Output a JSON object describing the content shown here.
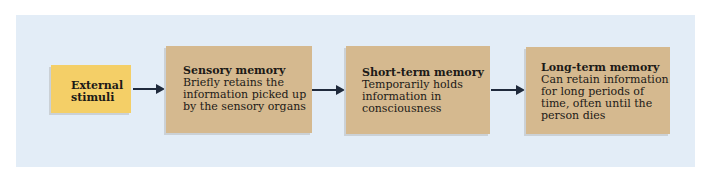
{
  "diagram": {
    "type": "flowchart",
    "direction": "left-to-right",
    "colors": {
      "panel_background": "#e3edf7",
      "stimuli_fill": "#f4cf67",
      "memory_fill": "#d5b98f",
      "arrow": "#1f2a3c",
      "text": "#1c1a17"
    },
    "nodes": [
      {
        "id": "external-stimuli",
        "lines": [
          "External",
          "stimuli"
        ]
      },
      {
        "id": "sensory-memory",
        "title": "Sensory memory",
        "description_lines": [
          "Briefly retains the",
          "information picked up",
          "by the sensory organs"
        ]
      },
      {
        "id": "short-term-memory",
        "title": "Short-term memory",
        "description_lines": [
          "Temporarily holds",
          "information in",
          "consciousness"
        ]
      },
      {
        "id": "long-term-memory",
        "title": "Long-term memory",
        "description_lines": [
          "Can retain information",
          "for long periods of",
          "time, often until the",
          "person dies"
        ]
      }
    ],
    "edges": [
      {
        "from": "external-stimuli",
        "to": "sensory-memory"
      },
      {
        "from": "sensory-memory",
        "to": "short-term-memory"
      },
      {
        "from": "short-term-memory",
        "to": "long-term-memory"
      }
    ]
  }
}
